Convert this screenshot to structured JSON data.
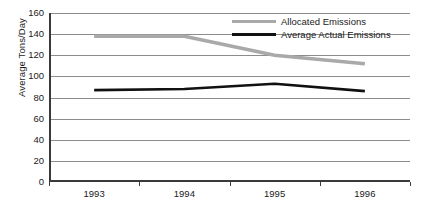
{
  "chart_data": {
    "type": "line",
    "title": "",
    "xlabel": "",
    "ylabel": "Average Tons/Day",
    "categories": [
      "1993",
      "1994",
      "1995",
      "1996"
    ],
    "ylim": [
      0,
      160
    ],
    "ytick_step": 20,
    "yticks": [
      "160",
      "140",
      "120",
      "100",
      "80",
      "60",
      "40",
      "20",
      "0"
    ],
    "grid": true,
    "legend_position": "top-right-inside",
    "series": [
      {
        "name": "Allocated Emissions",
        "color": "#a9a9a9",
        "values": [
          138,
          138,
          120,
          112
        ]
      },
      {
        "name": "Average Actual Emissions",
        "color": "#111111",
        "values": [
          87,
          88,
          93,
          86
        ]
      }
    ]
  },
  "axis": {
    "y_title": "Average Tons/Day",
    "y_labels": [
      "160",
      "140",
      "120",
      "100",
      "80",
      "60",
      "40",
      "20",
      "0"
    ],
    "x_labels": [
      "1993",
      "1994",
      "1995",
      "1996"
    ]
  },
  "legend": {
    "items": [
      {
        "label": "Allocated Emissions"
      },
      {
        "label": "Average Actual Emissions"
      }
    ]
  }
}
